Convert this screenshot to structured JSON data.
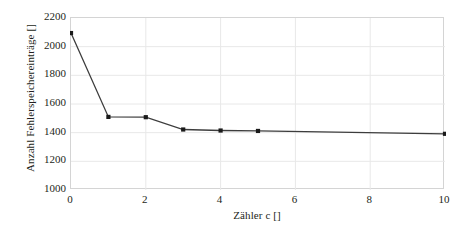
{
  "chart_data": {
    "type": "line",
    "title": "",
    "xlabel": "Zähler c []",
    "ylabel": "Anzahl Fehlerspeichereinträge []",
    "x": [
      0,
      1,
      2,
      3,
      4,
      5,
      10
    ],
    "values": [
      2095,
      1510,
      1508,
      1422,
      1415,
      1412,
      1392
    ],
    "series": [
      {
        "name": "Anzahl Fehlerspeichereinträge",
        "x": [
          0,
          1,
          2,
          3,
          4,
          5,
          10
        ],
        "values": [
          2095,
          1510,
          1508,
          1422,
          1415,
          1412,
          1392
        ]
      }
    ],
    "xlim": [
      0,
      10
    ],
    "ylim": [
      1000,
      2200
    ],
    "xticks": [
      0,
      2,
      4,
      6,
      8,
      10
    ],
    "yticks": [
      1000,
      1200,
      1400,
      1600,
      1800,
      2000,
      2200
    ],
    "xtick_labels": [
      "0",
      "2",
      "4",
      "6",
      "8",
      "10"
    ],
    "ytick_labels": [
      "1000",
      "1200",
      "1400",
      "1600",
      "1800",
      "2000",
      "2200"
    ],
    "grid": {
      "horizontal": true,
      "vertical": true,
      "color": "#e8e8e8"
    },
    "legend": {
      "visible": false,
      "position": "none"
    },
    "style": {
      "line_color": "#3d3d3d",
      "marker_color": "#1a1a1a",
      "marker_shape": "square",
      "plot_border_color": "#d4d4d4",
      "background": "#ffffff",
      "text_color": "#231f20"
    }
  }
}
